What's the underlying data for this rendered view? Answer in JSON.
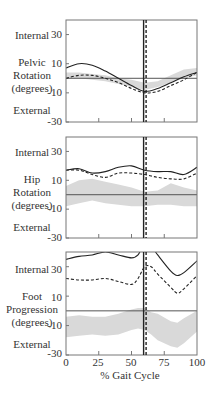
{
  "chart_data": [
    {
      "type": "line",
      "title": "Pelvic Rotation",
      "ylabel": "Pelvic Rotation (degrees)",
      "y_top_label": "Internal",
      "y_bottom_label": "External",
      "yticks": [
        "30",
        "10",
        "-10",
        "-30"
      ],
      "ylim": [
        -30,
        40
      ],
      "xlim": [
        0,
        100
      ],
      "vline": 60,
      "x": [
        0,
        10,
        20,
        30,
        40,
        50,
        60,
        70,
        80,
        90,
        100
      ],
      "series": [
        {
          "name": "solid",
          "style": "solid",
          "values": [
            7,
            10,
            9,
            5,
            0,
            -5,
            -9,
            -7,
            -3,
            1,
            4
          ]
        },
        {
          "name": "dashed",
          "style": "dashed",
          "values": [
            0,
            2,
            2,
            0,
            -3,
            -7,
            -10,
            -9,
            -5,
            -1,
            4
          ]
        },
        {
          "name": "normal band",
          "style": "band",
          "upper": [
            4,
            4,
            3,
            2,
            0,
            -1,
            -3,
            -2,
            2,
            6,
            7
          ],
          "lower": [
            0,
            0,
            -1,
            -2,
            -4,
            -6,
            -8,
            -6,
            -3,
            0,
            2
          ]
        }
      ]
    },
    {
      "type": "line",
      "title": "Hip Rotation",
      "ylabel": "Hip Rotation (degrees)",
      "y_top_label": "Internal",
      "y_bottom_label": "External",
      "yticks": [
        "30",
        "10",
        "-10",
        "-30"
      ],
      "ylim": [
        -30,
        40
      ],
      "xlim": [
        0,
        100
      ],
      "vline": 60,
      "x": [
        0,
        10,
        20,
        30,
        40,
        50,
        60,
        70,
        80,
        90,
        100
      ],
      "series": [
        {
          "name": "solid",
          "style": "solid",
          "values": [
            17,
            18,
            15,
            16,
            19,
            20,
            17,
            16,
            16,
            14,
            19
          ]
        },
        {
          "name": "dashed",
          "style": "dashed",
          "values": [
            17,
            17,
            14,
            12,
            15,
            15,
            14,
            12,
            11,
            11,
            15
          ]
        },
        {
          "name": "normal band",
          "style": "band",
          "upper": [
            6,
            10,
            11,
            9,
            7,
            5,
            2,
            3,
            8,
            5,
            3
          ],
          "lower": [
            -8,
            -6,
            -4,
            -6,
            -7,
            -8,
            -8,
            -7,
            -7,
            -8,
            -8
          ]
        }
      ]
    },
    {
      "type": "line",
      "title": "Foot Progression",
      "ylabel": "Foot Progression (degrees)",
      "y_top_label": "Internal",
      "y_bottom_label": "External",
      "yticks": [
        "30",
        "10",
        "-10",
        "-30"
      ],
      "ylim": [
        -30,
        40
      ],
      "xlim": [
        0,
        100
      ],
      "xticks": [
        "0",
        "25",
        "50",
        "75",
        "100"
      ],
      "xlabel": "% Gait Cycle",
      "vline": 60,
      "x": [
        0,
        10,
        20,
        30,
        40,
        50,
        55,
        60,
        65,
        70,
        80,
        85,
        90,
        100
      ],
      "series": [
        {
          "name": "solid",
          "style": "solid",
          "values": [
            35,
            37,
            38,
            40,
            38,
            36,
            38,
            46,
            44,
            38,
            27,
            24,
            26,
            34
          ]
        },
        {
          "name": "dashed",
          "style": "dashed",
          "values": [
            22,
            21,
            21,
            22,
            20,
            18,
            22,
            30,
            30,
            25,
            16,
            12,
            15,
            24
          ]
        },
        {
          "name": "normal band",
          "style": "band",
          "upper": [
            -4,
            -3,
            -4,
            -4,
            -2,
            1,
            2,
            2,
            -1,
            -2,
            -7,
            -8,
            -5,
            0
          ],
          "lower": [
            -18,
            -17,
            -16,
            -17,
            -16,
            -13,
            -12,
            -13,
            -16,
            -20,
            -24,
            -25,
            -22,
            -14
          ]
        }
      ]
    }
  ],
  "panels": [
    {
      "top_label": "Internal",
      "ylabel_lines": [
        "Pelvic",
        "Rotation",
        "(degrees)"
      ],
      "bottom_label": "External",
      "yticks": [
        "30",
        "10",
        "-10",
        "-30"
      ]
    },
    {
      "top_label": "Internal",
      "ylabel_lines": [
        "Hip",
        "Rotation",
        "(degrees)"
      ],
      "bottom_label": "External",
      "yticks": [
        "30",
        "10",
        "-10",
        "-30"
      ]
    },
    {
      "top_label": "Internal",
      "ylabel_lines": [
        "Foot",
        "Progression",
        "(degrees)"
      ],
      "bottom_label": "External",
      "yticks": [
        "30",
        "10",
        "-10",
        "-30"
      ]
    }
  ],
  "xaxis": {
    "ticks": [
      "0",
      "25",
      "50",
      "75",
      "100"
    ],
    "label": "% Gait Cycle"
  }
}
